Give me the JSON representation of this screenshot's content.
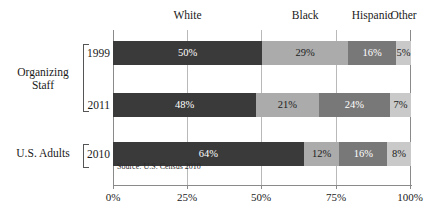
{
  "chart_data": {
    "type": "bar",
    "subtype": "stacked-horizontal-100",
    "title": "",
    "xlabel": "",
    "ylabel": "",
    "xlim": [
      0,
      100
    ],
    "grid": true,
    "legend_position": "top",
    "categories": [
      "1999",
      "2011",
      "2010"
    ],
    "series": [
      {
        "name": "White",
        "values": [
          50,
          48,
          64
        ]
      },
      {
        "name": "Black",
        "values": [
          29,
          21,
          12
        ]
      },
      {
        "name": "Hispanic",
        "values": [
          16,
          24,
          16
        ]
      },
      {
        "name": "Other",
        "values": [
          5,
          7,
          8
        ]
      }
    ],
    "x_ticks": [
      0,
      25,
      50,
      75,
      100
    ],
    "x_tick_labels": [
      "0%",
      "25%",
      "50%",
      "75%",
      "100%"
    ],
    "annotations": [
      "Source: U.S. Census 2010"
    ],
    "colors": {
      "White": "#3a3a3a",
      "Black": "#ababab",
      "Hispanic": "#787878",
      "Other": "#c9c9c9"
    }
  },
  "headers": [
    {
      "label": "White",
      "center_pct": 25
    },
    {
      "label": "Black",
      "center_pct": 64.5
    },
    {
      "label": "Hispanic",
      "center_pct": 87
    },
    {
      "label": "Other",
      "center_pct": 97.5
    }
  ],
  "axis": {
    "ticks": [
      {
        "label": "0%",
        "pct": 0
      },
      {
        "label": "25%",
        "pct": 25
      },
      {
        "label": "50%",
        "pct": 50
      },
      {
        "label": "75%",
        "pct": 75
      },
      {
        "label": "100%",
        "pct": 100
      }
    ]
  },
  "rows": [
    {
      "year": "1999",
      "segments": [
        {
          "name": "White",
          "label": "50%",
          "value": 50
        },
        {
          "name": "Black",
          "label": "29%",
          "value": 29
        },
        {
          "name": "Hispanic",
          "label": "16%",
          "value": 16
        },
        {
          "name": "Other",
          "label": "5%",
          "value": 5
        }
      ]
    },
    {
      "year": "2011",
      "segments": [
        {
          "name": "White",
          "label": "48%",
          "value": 48
        },
        {
          "name": "Black",
          "label": "21%",
          "value": 21
        },
        {
          "name": "Hispanic",
          "label": "24%",
          "value": 24
        },
        {
          "name": "Other",
          "label": "7%",
          "value": 7
        }
      ]
    },
    {
      "year": "2010",
      "segments": [
        {
          "name": "White",
          "label": "64%",
          "value": 64
        },
        {
          "name": "Black",
          "label": "12%",
          "value": 12
        },
        {
          "name": "Hispanic",
          "label": "16%",
          "value": 16
        },
        {
          "name": "Other",
          "label": "8%",
          "value": 8
        }
      ]
    }
  ],
  "groups": [
    {
      "label_line1": "Organizing",
      "label_line2": "Staff"
    },
    {
      "label_line1": "U.S. Adults",
      "label_line2": ""
    }
  ],
  "source_note": "Source: U.S. Census 2010"
}
